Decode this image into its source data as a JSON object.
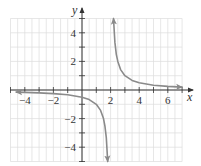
{
  "chart_data": {
    "type": "line",
    "title": "",
    "function": "y = 1/(x - 2)",
    "xlabel": "x",
    "ylabel": "y",
    "xlim": [
      -5,
      7
    ],
    "ylim": [
      -5,
      5
    ],
    "grid": true,
    "x_ticks": [
      -4,
      -2,
      2,
      4,
      6
    ],
    "y_ticks": [
      4,
      2,
      -2,
      -4
    ],
    "x_tick_labels": [
      "−4",
      "−2",
      "2",
      "4",
      "6"
    ],
    "y_tick_labels": [
      "4",
      "2",
      "−2",
      "−4"
    ],
    "vertical_asymptote": 2,
    "horizontal_asymptote": 0,
    "series": [
      {
        "name": "left branch",
        "x": [
          -4.6,
          -4,
          -3,
          -2,
          -1,
          0,
          0.5,
          1,
          1.3,
          1.5,
          1.6,
          1.7,
          1.8
        ],
        "y": [
          -0.15,
          -0.17,
          -0.2,
          -0.25,
          -0.33,
          -0.5,
          -0.67,
          -1,
          -1.43,
          -2,
          -2.5,
          -3.33,
          -5
        ]
      },
      {
        "name": "right branch",
        "x": [
          2.2,
          2.3,
          2.4,
          2.5,
          2.7,
          3,
          3.5,
          4,
          5,
          6,
          7
        ],
        "y": [
          5,
          3.33,
          2.5,
          2,
          1.43,
          1,
          0.67,
          0.5,
          0.33,
          0.25,
          0.2
        ]
      }
    ],
    "colors": {
      "curve": "#8a8a8a",
      "axis": "#333333",
      "grid": "#dcdcdc"
    }
  }
}
